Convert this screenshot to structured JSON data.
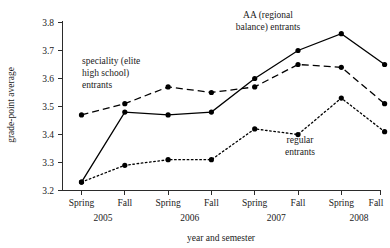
{
  "chart_data": {
    "type": "line",
    "title": "",
    "xlabel": "year and semester",
    "ylabel": "grade-point average",
    "categories": [
      "Spring",
      "Fall",
      "Spring",
      "Fall",
      "Spring",
      "Fall",
      "Spring",
      "Fall"
    ],
    "group_labels": [
      "2005",
      "2006",
      "2007",
      "2008"
    ],
    "ylim": [
      3.2,
      3.8
    ],
    "yticks": [
      3.2,
      3.3,
      3.4,
      3.5,
      3.6,
      3.7,
      3.8
    ],
    "ytick_labels": [
      "3.2",
      "3.3",
      "3.4",
      "3.5",
      "3.6",
      "3.7",
      "3.8"
    ],
    "grid": false,
    "legend_position": "inline-annotations",
    "series": [
      {
        "name": "AA (regional balance) entrants",
        "style": "solid",
        "values": [
          3.23,
          3.48,
          3.47,
          3.48,
          3.6,
          3.7,
          3.76,
          3.65
        ]
      },
      {
        "name": "speciality (elite high school) entrants",
        "style": "dashed",
        "values": [
          3.47,
          3.51,
          3.57,
          3.55,
          3.57,
          3.65,
          3.64,
          3.51
        ]
      },
      {
        "name": "regular entrants",
        "style": "dotted",
        "values": [
          3.23,
          3.29,
          3.31,
          3.31,
          3.42,
          3.4,
          3.53,
          3.41
        ]
      }
    ],
    "annotations": [
      {
        "id": "speciality",
        "lines": [
          "speciality (elite",
          "high school)",
          "entrants"
        ]
      },
      {
        "id": "aa",
        "lines": [
          "AA (regional",
          "balance) entrants"
        ]
      },
      {
        "id": "regular",
        "lines": [
          "regular",
          "entrants"
        ]
      }
    ]
  }
}
